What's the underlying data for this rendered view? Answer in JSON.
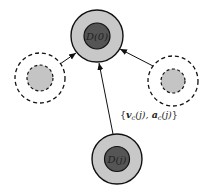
{
  "diagram": {
    "nodes": [
      {
        "id": "top",
        "label": "D(0)",
        "cx": 97,
        "cy": 36,
        "outer_r": 26,
        "inner_r": 13,
        "style": "solid"
      },
      {
        "id": "bottom",
        "label": "D(j)",
        "cx": 117,
        "cy": 159,
        "outer_r": 25,
        "inner_r": 12.5,
        "style": "solid"
      },
      {
        "id": "left",
        "label": "",
        "cx": 40,
        "cy": 78,
        "outer_r": 25,
        "inner_r": 13,
        "style": "dashed"
      },
      {
        "id": "right",
        "label": "",
        "cx": 173,
        "cy": 81,
        "outer_r": 25,
        "inner_r": 12,
        "style": "dashed"
      }
    ],
    "edges": [
      {
        "from": "left",
        "to": "top"
      },
      {
        "from": "right",
        "to": "top"
      },
      {
        "from": "bottom",
        "to": "top"
      }
    ],
    "edge_label": "{v_c(j), a_c(j)}",
    "edge_label_display": "{vc(j), ac(j)}",
    "colors": {
      "outer_fill": "#c8c8c8",
      "inner_fill": "#555555",
      "dashed_inner_fill": "#c4c4c4",
      "stroke": "#111111"
    }
  }
}
